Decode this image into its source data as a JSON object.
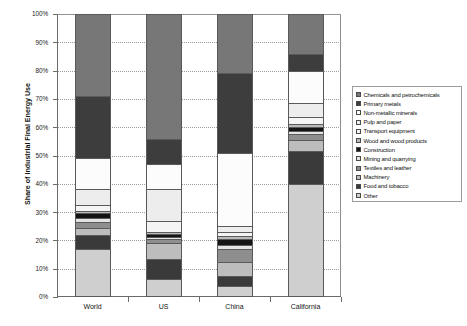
{
  "chart_data": {
    "type": "bar",
    "subtype": "stacked-100-percent",
    "title": "",
    "xlabel": "",
    "ylabel": "Share of Industrial Final Energy Use",
    "ylim": [
      0,
      100
    ],
    "ytick_labels": [
      "0%",
      "10%",
      "20%",
      "30%",
      "40%",
      "50%",
      "60%",
      "70%",
      "80%",
      "90%",
      "100%"
    ],
    "ytick_values": [
      0,
      10,
      20,
      30,
      40,
      50,
      60,
      70,
      80,
      90,
      100
    ],
    "grid": true,
    "legend_position": "right",
    "categories": [
      "World",
      "US",
      "China",
      "California"
    ],
    "series": [
      {
        "name": "Other",
        "values": [
          17.0,
          6.5,
          4.0,
          40.0
        ]
      },
      {
        "name": "Food and tobacco",
        "values": [
          5.0,
          7.0,
          3.5,
          11.5
        ]
      },
      {
        "name": "Machinery",
        "values": [
          2.5,
          5.5,
          5.0,
          4.0
        ]
      },
      {
        "name": "Textiles and leather",
        "values": [
          2.0,
          1.5,
          4.5,
          2.0
        ]
      },
      {
        "name": "Mining and quarrying",
        "values": [
          1.5,
          0.8,
          1.5,
          1.0
        ]
      },
      {
        "name": "Construction",
        "values": [
          1.5,
          0.9,
          2.0,
          1.5
        ]
      },
      {
        "name": "Wood and wood products",
        "values": [
          1.0,
          0.8,
          1.0,
          1.0
        ]
      },
      {
        "name": "Transport equipment",
        "values": [
          2.0,
          4.0,
          1.5,
          2.5
        ]
      },
      {
        "name": "Pulp and paper",
        "values": [
          5.5,
          11.0,
          2.0,
          5.0
        ]
      },
      {
        "name": "Non-metallic minerals",
        "values": [
          11.0,
          9.0,
          26.0,
          11.5
        ]
      },
      {
        "name": "Primary metals",
        "values": [
          22.0,
          9.0,
          28.0,
          6.0
        ]
      },
      {
        "name": "Chemicals and petrochemicals",
        "values": [
          29.0,
          44.0,
          21.0,
          14.0
        ]
      }
    ],
    "legend_entries": [
      "Chemicals and petrochemicals",
      "Primary metals",
      "Non-metallic minerals",
      "Pulp and paper",
      "Transport equipment",
      "Wood and wood products",
      "Construction",
      "Mining and quarrying",
      "Textiles and leather",
      "Machinery",
      "Food and tobacco",
      "Other"
    ],
    "series_colors": {
      "Chemicals and petrochemicals": "#777777",
      "Primary metals": "#3d3d3d",
      "Non-metallic minerals": "#fcfcfc",
      "Pulp and paper": "#ededed",
      "Transport equipment": "#f4f4f4",
      "Wood and wood products": "#b9b9b9",
      "Construction": "#141414",
      "Mining and quarrying": "#e4e4e4",
      "Textiles and leather": "#8e8e8e",
      "Machinery": "#bdbdbd",
      "Food and tobacco": "#3a3a3a",
      "Other": "#cfcfcf"
    }
  }
}
